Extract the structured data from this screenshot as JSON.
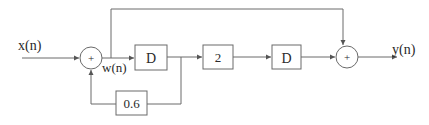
{
  "diagram": {
    "type": "signal-flow block diagram",
    "input_label": "x(n)",
    "output_label": "y(n)",
    "intermediate_label": "w(n)",
    "summers": [
      {
        "id": "sum1",
        "symbol": "+"
      },
      {
        "id": "sum2",
        "symbol": "+"
      }
    ],
    "blocks": [
      {
        "id": "delay1",
        "label": "D"
      },
      {
        "id": "gain2",
        "label": "2"
      },
      {
        "id": "delay2",
        "label": "D"
      },
      {
        "id": "feedback_gain",
        "label": "0.6"
      }
    ],
    "connections": [
      "x(n) -> sum1",
      "sum1 -> w(n) -> delay1",
      "w(n) -> sum2 (feedforward, top path)",
      "delay1 -> gain2",
      "delay1 -> feedback_gain -> sum1",
      "gain2 -> delay2",
      "delay2 -> sum2",
      "sum2 -> y(n)"
    ]
  }
}
